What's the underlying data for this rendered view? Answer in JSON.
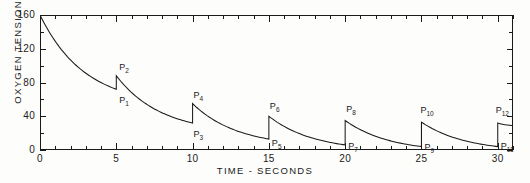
{
  "chart_data": {
    "type": "line",
    "title": "",
    "xlabel": "TIME - SECONDS",
    "ylabel": "OXYGEN TENSION-MM HG",
    "xlim": [
      0,
      31
    ],
    "ylim": [
      0,
      160
    ],
    "xticks_major": [
      0,
      5,
      10,
      15,
      20,
      25,
      30
    ],
    "xticks_major_labels": [
      "0",
      "5",
      "10",
      "15",
      "20",
      "25",
      "30"
    ],
    "xtick_minor_step": 1,
    "yticks_major": [
      0,
      40,
      80,
      120,
      160
    ],
    "yticks_major_labels": [
      "0",
      "40",
      "80",
      "120",
      "160"
    ],
    "ytick_minor_step": 20,
    "grid": false,
    "legend": null,
    "annotations": [
      {
        "label": "P1",
        "x": 5,
        "y": 72
      },
      {
        "label": "P2",
        "x": 5,
        "y": 88
      },
      {
        "label": "P3",
        "x": 10,
        "y": 32
      },
      {
        "label": "P4",
        "x": 10,
        "y": 55
      },
      {
        "label": "P5",
        "x": 15,
        "y": 13
      },
      {
        "label": "P6",
        "x": 15,
        "y": 40
      },
      {
        "label": "P7",
        "x": 20,
        "y": 6
      },
      {
        "label": "P8",
        "x": 20,
        "y": 35
      },
      {
        "label": "P9",
        "x": 25,
        "y": 4
      },
      {
        "label": "P10",
        "x": 25,
        "y": 33
      },
      {
        "label": "P11",
        "x": 30,
        "y": 4
      },
      {
        "label": "P12",
        "x": 30,
        "y": 32
      }
    ],
    "segments": [
      {
        "from_x": 0,
        "to_x": 5,
        "start_y": 160,
        "end_y": 72
      },
      {
        "from_x": 5,
        "to_x": 10,
        "start_y": 88,
        "end_y": 32
      },
      {
        "from_x": 10,
        "to_x": 15,
        "start_y": 55,
        "end_y": 13
      },
      {
        "from_x": 15,
        "to_x": 20,
        "start_y": 40,
        "end_y": 6
      },
      {
        "from_x": 20,
        "to_x": 25,
        "start_y": 35,
        "end_y": 4
      },
      {
        "from_x": 25,
        "to_x": 30,
        "start_y": 33,
        "end_y": 4
      },
      {
        "from_x": 30,
        "to_x": 31,
        "start_y": 32,
        "end_y": 29
      }
    ],
    "colors": {
      "line": "#1a1a1a",
      "axis": "#1a1a1a",
      "background": "#fdfdfc"
    }
  },
  "labels": {
    "p1": "P",
    "p1s": "1",
    "p2": "P",
    "p2s": "2",
    "p3": "P",
    "p3s": "3",
    "p4": "P",
    "p4s": "4",
    "p5": "P",
    "p5s": "5",
    "p6": "P",
    "p6s": "6",
    "p7": "P",
    "p7s": "7",
    "p8": "P",
    "p8s": "8",
    "p9": "P",
    "p9s": "9",
    "p10": "P",
    "p10s": "10",
    "p11": "P",
    "p11s": "11",
    "p12": "P",
    "p12s": "12"
  }
}
